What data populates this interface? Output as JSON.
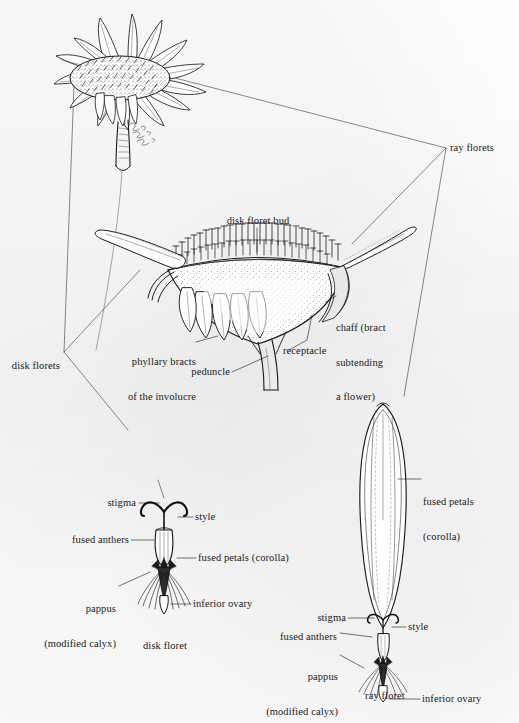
{
  "figure": {
    "background_color": "#fbfbfb",
    "ink_color": "#1a1a1a",
    "signature": "artist signature (cursive, illegible)"
  },
  "panels": {
    "whole_head": {
      "name": "whole flower head",
      "description": "ink drawing of a daisy-like composite flower head in three-quarter view with peduncle"
    },
    "section": {
      "name": "longitudinal section of flower head",
      "description": "cut-away showing receptacle, chaff, phyllary bracts, disk floret buds and two ray florets"
    },
    "disk_floret": {
      "name": "disk floret detail",
      "description": "single disk floret with stigma, style, fused anthers, corolla, pappus and inferior ovary"
    },
    "ray_floret": {
      "name": "ray floret detail",
      "description": "single strap-shaped ray floret with fused petals forming the ligule"
    }
  },
  "labels": {
    "ray_florets": "ray florets",
    "disk_florets": "disk florets",
    "disk_floret_bud": "disk floret bud",
    "chaff": "chaff (bract\nsubtending\na flower)",
    "chaff_line1": "chaff (bract",
    "chaff_line2": "subtending",
    "chaff_line3": "a flower)",
    "phyllary_bracts": "phyllary bracts\nof the involucre",
    "phyllary_line1": "phyllary bracts",
    "phyllary_line2": "of the involucre",
    "receptacle": "receptacle",
    "peduncle": "peduncle",
    "stigma": "stigma",
    "style": "style",
    "fused_anthers": "fused anthers",
    "fused_petals_corolla": "fused petals (corolla)",
    "fused_petals": "fused petals",
    "corolla": "(corolla)",
    "pappus_line1": "pappus",
    "pappus_line2": "(modified calyx)",
    "inferior_ovary": "inferior ovary"
  },
  "captions": {
    "disk_floret": "disk floret",
    "ray_floret": "ray floret"
  }
}
